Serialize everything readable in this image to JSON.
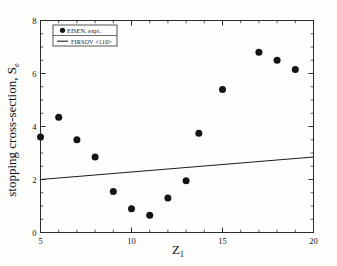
{
  "chart_data": {
    "type": "scatter",
    "title": "",
    "xlabel": "Z1",
    "xlabel_base": "Z",
    "xlabel_sub": "1",
    "ylabel": "stopping cross-section, Se",
    "ylabel_base": "stopping cross-section, S",
    "ylabel_sub": "e",
    "xlim": [
      5,
      20
    ],
    "ylim": [
      0,
      8
    ],
    "xticks": [
      5,
      10,
      15,
      20
    ],
    "yticks": [
      0,
      2,
      4,
      6,
      8
    ],
    "xtick_labels": [
      "5",
      "10",
      "15",
      "20"
    ],
    "ytick_labels": [
      "0",
      "2",
      "4",
      "6",
      "8"
    ],
    "x_minor_interval": 1,
    "y_minor_interval": 0.5,
    "grid": false,
    "legend_position": "upper-left",
    "series": [
      {
        "name": "EISEN, expt.",
        "type": "scatter",
        "marker": "filled-circle",
        "color": "#141414",
        "points": [
          {
            "x": 5.0,
            "y": 3.6
          },
          {
            "x": 6.0,
            "y": 4.35
          },
          {
            "x": 7.0,
            "y": 3.5
          },
          {
            "x": 8.0,
            "y": 2.85
          },
          {
            "x": 9.0,
            "y": 1.55
          },
          {
            "x": 10.0,
            "y": 0.9
          },
          {
            "x": 11.0,
            "y": 0.65
          },
          {
            "x": 12.0,
            "y": 1.3
          },
          {
            "x": 13.0,
            "y": 1.95
          },
          {
            "x": 13.7,
            "y": 3.75
          },
          {
            "x": 15.0,
            "y": 5.4
          },
          {
            "x": 17.0,
            "y": 6.8
          },
          {
            "x": 18.0,
            "y": 6.5
          },
          {
            "x": 19.0,
            "y": 6.15
          }
        ]
      },
      {
        "name": "FIRSOV <110>",
        "type": "line",
        "color": "#1c1c1c",
        "points": [
          {
            "x": 5.0,
            "y": 2.0
          },
          {
            "x": 20.0,
            "y": 2.85
          }
        ]
      }
    ],
    "legend": [
      {
        "label": "EISEN, expt.",
        "marker": "filled-circle",
        "color": "#141414"
      },
      {
        "label": "FIRSOV <110>",
        "marker": "line",
        "color": "#1c1c1c"
      }
    ]
  },
  "colors": {
    "axis": "#2b2b2b",
    "marker": "#141414",
    "line": "#1c1c1c",
    "background": "#fdfdfc"
  }
}
